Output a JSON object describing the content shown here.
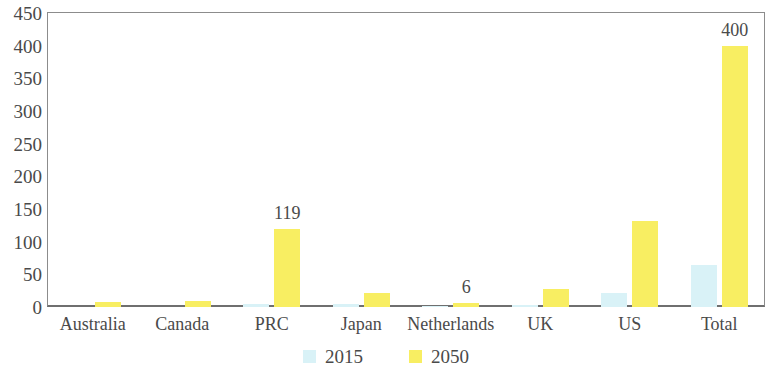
{
  "chart_data": {
    "type": "bar",
    "title": "",
    "subtitle": "",
    "xlabel": "",
    "ylabel": "",
    "ylim": [
      0,
      450
    ],
    "ytick_step": 50,
    "yticks": [
      450,
      400,
      350,
      300,
      250,
      200,
      150,
      100,
      50,
      0
    ],
    "grid": false,
    "legend_position": "bottom-center",
    "categories": [
      "Australia",
      "Canada",
      "PRC",
      "Japan",
      "Netherlands",
      "UK",
      "US",
      "Total"
    ],
    "series": [
      {
        "name": "2015",
        "color": "#d9f2f7",
        "values": [
          0,
          0,
          5,
          4,
          1,
          3,
          21,
          65
        ],
        "labels": [
          "",
          "",
          "",
          "",
          "",
          "",
          "",
          ""
        ]
      },
      {
        "name": "2050",
        "color": "#f8ee62",
        "values": [
          8,
          9,
          119,
          22,
          6,
          27,
          132,
          400
        ],
        "labels": [
          "",
          "",
          "119",
          "",
          "6",
          "",
          "",
          "400"
        ]
      }
    ]
  },
  "axes": {
    "y_tick_labels": [
      "450",
      "400",
      "350",
      "300",
      "250",
      "200",
      "150",
      "100",
      "50",
      "0"
    ],
    "x_tick_labels": [
      "Australia",
      "Canada",
      "PRC",
      "Japan",
      "Netherlands",
      "UK",
      "US",
      "Total"
    ]
  },
  "legend": {
    "items": [
      {
        "label": "2015",
        "color": "#d9f2f7"
      },
      {
        "label": "2050",
        "color": "#f8ee62"
      }
    ]
  }
}
